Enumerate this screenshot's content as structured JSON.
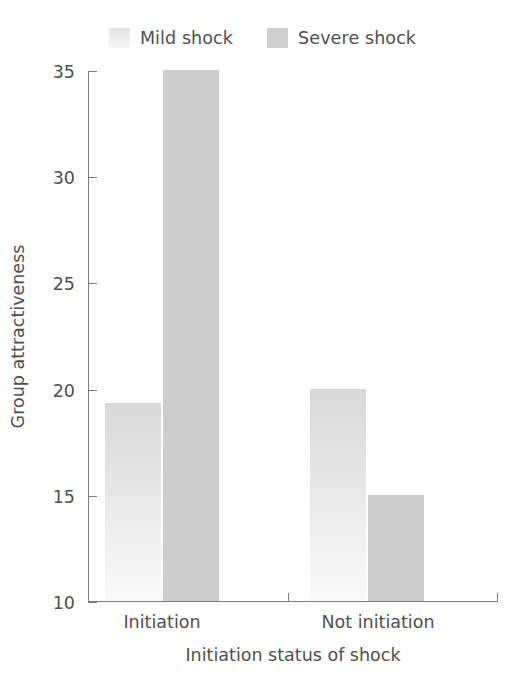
{
  "chart_data": {
    "type": "bar",
    "title": "",
    "subtitle": "",
    "xlabel": "Initiation status of shock",
    "ylabel": "Group attractiveness",
    "categories": [
      "Initiation",
      "Not initiation"
    ],
    "series": [
      {
        "name": "Mild shock",
        "values": [
          19.3,
          20.0
        ],
        "color": "#ececec"
      },
      {
        "name": "Severe shock",
        "values": [
          35.0,
          15.0
        ],
        "color": "#cdcdcd"
      }
    ],
    "ylim": [
      10,
      35
    ],
    "yticks": [
      10,
      15,
      20,
      25,
      30,
      35
    ],
    "ytick_labels": [
      "10",
      "15",
      "20",
      "25",
      "30",
      "35"
    ],
    "grid": false,
    "legend_position": "top-center",
    "bar_group_gap": true
  },
  "legend": {
    "entries": [
      {
        "label": "Mild shock",
        "swatch": "mild-shock-swatch"
      },
      {
        "label": "Severe shock",
        "swatch": "severe-shock-swatch"
      }
    ]
  },
  "axes": {
    "y_title": "Group attractiveness",
    "x_title": "Initiation status of shock",
    "y_tick_labels": [
      "35",
      "30",
      "25",
      "20",
      "15",
      "10"
    ],
    "x_category_labels": [
      "Initiation",
      "Not initiation"
    ]
  },
  "colors": {
    "axis": "#7d7d7d",
    "text": "#4f4f4f",
    "background": "#ffffff",
    "mild_shock": "#ececec",
    "severe_shock": "#cdcdcd"
  }
}
